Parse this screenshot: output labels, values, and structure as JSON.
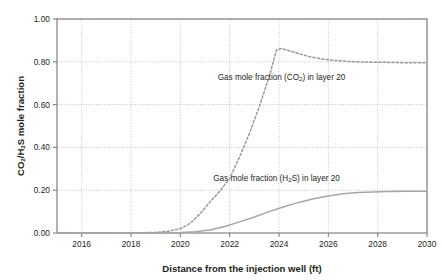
{
  "chart_data": {
    "type": "line",
    "title": "",
    "xlabel": "Distance from the injection well (ft)",
    "ylabel": "CO2/H2S mole fraction",
    "xlim": [
      2015,
      2030
    ],
    "ylim": [
      0.0,
      1.0
    ],
    "grid": true,
    "legend_position": "inline-annotation",
    "x_ticks": [
      "2016",
      "2018",
      "2020",
      "2022",
      "2024",
      "2026",
      "2028",
      "2030"
    ],
    "x_tick_values": [
      2016,
      2018,
      2020,
      2022,
      2024,
      2026,
      2028,
      2030
    ],
    "y_ticks": [
      "0.00",
      "0.20",
      "0.40",
      "0.60",
      "0.80",
      "1.00"
    ],
    "y_tick_values": [
      0.0,
      0.2,
      0.4,
      0.6,
      0.8,
      1.0
    ],
    "series": [
      {
        "name": "Gas mole fraction (CO2) in layer 20",
        "style": "dashed",
        "color": "#999999",
        "x": [
          2015.0,
          2016.0,
          2017.0,
          2018.0,
          2019.0,
          2019.5,
          2020.0,
          2020.4,
          2020.8,
          2021.2,
          2021.6,
          2022.0,
          2022.4,
          2022.8,
          2023.2,
          2023.6,
          2023.9,
          2024.1,
          2024.6,
          2025.2,
          2025.8,
          2026.4,
          2027.0,
          2028.0,
          2029.0,
          2030.0
        ],
        "values": [
          0.0,
          0.0,
          0.0,
          0.0,
          0.003,
          0.008,
          0.02,
          0.045,
          0.09,
          0.145,
          0.195,
          0.255,
          0.355,
          0.465,
          0.59,
          0.73,
          0.855,
          0.862,
          0.845,
          0.825,
          0.812,
          0.805,
          0.8,
          0.798,
          0.796,
          0.795
        ]
      },
      {
        "name": "Gas mole fraction (H2S) in layer 20",
        "style": "solid",
        "color": "#a6a6a6",
        "x": [
          2015.0,
          2016.0,
          2017.0,
          2018.0,
          2019.0,
          2020.0,
          2020.6,
          2021.2,
          2021.8,
          2022.4,
          2023.0,
          2023.6,
          2024.2,
          2024.8,
          2025.4,
          2026.0,
          2026.6,
          2027.2,
          2027.8,
          2028.4,
          2029.2,
          2030.0
        ],
        "values": [
          0.0,
          0.0,
          0.0,
          0.0,
          0.0,
          0.002,
          0.006,
          0.014,
          0.03,
          0.052,
          0.075,
          0.1,
          0.123,
          0.143,
          0.16,
          0.173,
          0.183,
          0.189,
          0.192,
          0.194,
          0.195,
          0.195
        ]
      }
    ],
    "annotations": [
      {
        "id": "co2-annotation",
        "text_parts": [
          "Gas mole fraction (CO",
          "2",
          ") in layer 20"
        ],
        "x": 2024.1,
        "y": 0.715
      },
      {
        "id": "h2s-annotation",
        "text_parts": [
          "Gas mole fraction (H",
          "2",
          "S) in layer 20"
        ],
        "x": 2023.9,
        "y": 0.245
      }
    ]
  },
  "axis": {
    "y_title_parts": [
      "CO",
      "2",
      "/H",
      "2",
      "S mole fraction"
    ],
    "x_title": "Distance from the injection well (ft)"
  },
  "colors": {
    "background": "#ffffff",
    "frame": "#808080",
    "grid": "#b3b3b3",
    "text": "#231f20",
    "co2_series": "#999999",
    "h2s_series": "#a6a6a6"
  }
}
